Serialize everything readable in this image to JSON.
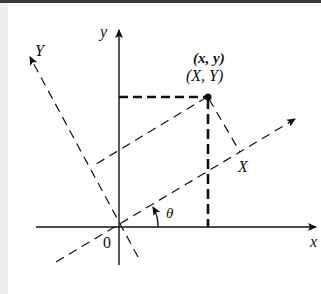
{
  "diagram": {
    "labels": {
      "y_axis": "y",
      "x_axis": "x",
      "Y_axis": "Y",
      "X_axis": "X",
      "origin": "0",
      "angle": "θ",
      "point_xy": "(x, y)",
      "point_XY": "(X, Y)"
    },
    "colors": {
      "ink": "#111111",
      "background": "#ffffff",
      "left_strip": "#ececec",
      "top_border": "#3a3a3a"
    },
    "geometry": {
      "origin_px": [
        119,
        227
      ],
      "point_px": [
        208,
        97
      ],
      "rotation_angle_deg": 31
    }
  }
}
